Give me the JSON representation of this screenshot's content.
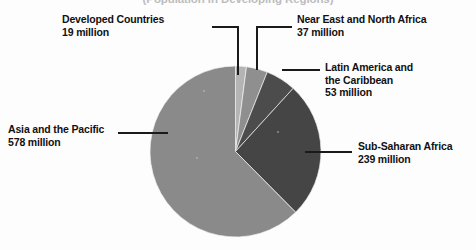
{
  "chart_data": {
    "type": "pie",
    "title": "(Population in Developing Regions)",
    "subtitle": "",
    "xlabel": "",
    "ylabel": "",
    "legend_position": "callout-labels",
    "grid": false,
    "units": "million",
    "total": 926,
    "categories": [
      "Developed Countries",
      "Near East and North Africa",
      "Latin America and the Caribbean",
      "Sub-Saharan Africa",
      "Asia and the Pacific"
    ],
    "values": [
      19,
      37,
      53,
      239,
      578
    ],
    "value_labels": [
      "19 million",
      "37 million",
      "53 million",
      "239 million",
      "578 million"
    ],
    "slices": [
      {
        "name": "Developed Countries",
        "value": 19,
        "value_label": "19 million",
        "percent": 2.05,
        "color": "#b4b4b4",
        "start_angle": 0.0,
        "end_angle": 7.4
      },
      {
        "name": "Near East and North Africa",
        "value": 37,
        "value_label": "37 million",
        "percent": 4.0,
        "color": "#8f8f8f",
        "start_angle": 7.4,
        "end_angle": 21.8
      },
      {
        "name": "Latin America and the Caribbean",
        "value": 53,
        "value_label": "53 million",
        "percent": 5.72,
        "color": "#4c4c4c",
        "start_angle": 21.8,
        "end_angle": 42.4
      },
      {
        "name": "Sub-Saharan Africa",
        "value": 239,
        "value_label": "239 million",
        "percent": 25.81,
        "color": "#454545",
        "start_angle": 42.4,
        "end_angle": 135.3
      },
      {
        "name": "Asia and the Pacific",
        "value": 578,
        "value_label": "578 million",
        "percent": 62.42,
        "color": "#8a8a8a",
        "start_angle": 135.3,
        "end_angle": 360.0
      }
    ]
  },
  "callouts": {
    "developed": {
      "line1": "Developed Countries",
      "line2": "19 million"
    },
    "near_east": {
      "line1": "Near East and North Africa",
      "line2": "37 million"
    },
    "latin_america": {
      "line1": "Latin America and",
      "line2": "the Caribbean",
      "line3": "53 million"
    },
    "asia": {
      "line1": "Asia and the Pacific",
      "line2": "578 million"
    },
    "sub_saharan": {
      "line1": "Sub-Saharan Africa",
      "line2": "239 million"
    }
  },
  "colors": {
    "background": "#fdfdfd",
    "text": "#111111",
    "leader_line": "#1a1a1a",
    "slice_light": "#b4b4b4",
    "slice_medium": "#8f8f8f",
    "slice_asia": "#8a8a8a",
    "slice_dark": "#454545",
    "slice_dark_alt": "#4c4c4c"
  }
}
